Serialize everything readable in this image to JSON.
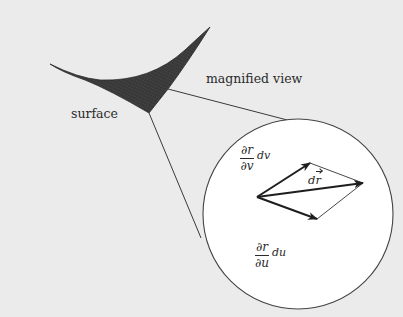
{
  "figure": {
    "background_color": "#ebebeb",
    "ink_color": "#2a2a2a",
    "magnifier_fill": "#ffffff",
    "surface_fill": "#3a3a3a"
  },
  "labels": {
    "surface": "surface",
    "magnified_view": "magnified view"
  },
  "vectors": {
    "partial_v": {
      "numerator": "∂r",
      "denominator": "∂v",
      "differential": "dv"
    },
    "partial_u": {
      "numerator": "∂r",
      "denominator": "∂u",
      "differential": "du"
    },
    "dr": {
      "d": "d",
      "r": "r"
    }
  },
  "geometry": {
    "magnifier_circle": {
      "cx": 298,
      "cy": 214,
      "r": 95
    },
    "vector_origin": [
      257,
      197
    ],
    "partial_v_tip": [
      310,
      163
    ],
    "dr_tip": [
      363,
      183
    ],
    "partial_u_tip": [
      317,
      219
    ]
  }
}
